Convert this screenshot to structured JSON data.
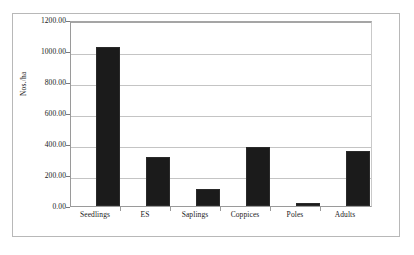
{
  "chart_data": {
    "type": "bar",
    "title": "",
    "subtitle": "",
    "xlabel": "",
    "ylabel": "Nos./ha",
    "categories": [
      "Seedlings",
      "ES",
      "Saplings",
      "Coppices",
      "Poles",
      "Adults"
    ],
    "values": [
      1055,
      322,
      110,
      393,
      20,
      368
    ],
    "series": [
      {
        "name": "Nos./ha",
        "values": [
          1055,
          322,
          110,
          393,
          20,
          368
        ]
      }
    ],
    "ylim": [
      0,
      1200
    ],
    "y_tick_values": [
      0,
      200,
      400,
      600,
      800,
      1000,
      1200
    ],
    "y_tick_labels": [
      "0.00",
      "200.00",
      "400.00",
      "600.00",
      "800.00",
      "1000.00",
      "1200.00"
    ],
    "grid": true,
    "grid_axis": "y",
    "legend": false,
    "legend_position": "none",
    "bar_color": "#1b1b1b",
    "plot_background": "#ffffff",
    "gridline_color": "#c4c4c4",
    "axis_color": "#9a9a9a",
    "frame_color": "#b8b8b8"
  }
}
